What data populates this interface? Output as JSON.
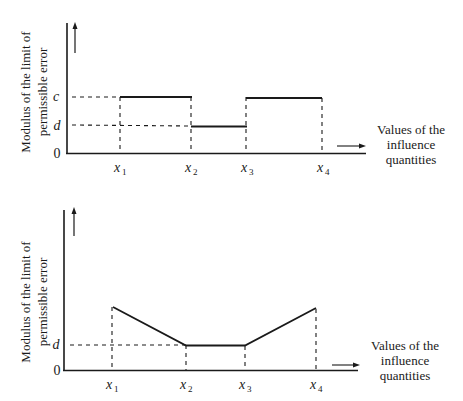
{
  "diagrams": [
    {
      "id": "top",
      "ylabel_line1": "Modulus of the limit of",
      "ylabel_line2": "permissible error",
      "y_ticks": {
        "c": "c",
        "d": "d",
        "zero": "0"
      },
      "x_ticks": [
        "x1",
        "x2",
        "x3",
        "x4"
      ],
      "x_tick_main": "x",
      "x_tick_subs": [
        "1",
        "2",
        "3",
        "4"
      ],
      "xlabel_line1": "Values of the",
      "xlabel_line2": "influence",
      "xlabel_line3": "quantities",
      "shape": "step: c on [x1,x2], d on [x2,x3], c on [x3,x4]"
    },
    {
      "id": "bottom",
      "ylabel_line1": "Modulus of the limit of",
      "ylabel_line2": "permissible error",
      "y_ticks": {
        "d": "d",
        "zero": "0"
      },
      "x_ticks": [
        "x1",
        "x2",
        "x3",
        "x4"
      ],
      "x_tick_main": "x",
      "x_tick_subs": [
        "1",
        "2",
        "3",
        "4"
      ],
      "xlabel_line1": "Values of the",
      "xlabel_line2": "influence",
      "xlabel_line3": "quantities",
      "shape": "linear decrease from x1 to d at x2, constant d to x3, linear increase to x4"
    }
  ]
}
